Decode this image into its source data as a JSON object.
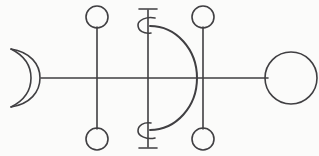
{
  "figure": {
    "title": "Alchemical line symbol diagram",
    "background_color": "#fbfbfa",
    "stroke_color": "#403f42",
    "width": 319,
    "height": 156,
    "baseline_y": 78,
    "elements": {
      "crescent": {
        "label": "crescent-moon",
        "cx": 24,
        "cy": 78,
        "outer_radius": 30,
        "opening": "left"
      },
      "baseline": {
        "label": "horizontal-axis-line",
        "x1": 41,
        "x2": 268,
        "y": 78
      },
      "left_vertical": {
        "label": "left-vertical-stem",
        "x": 97,
        "y1": 25,
        "y2": 131
      },
      "right_vertical": {
        "label": "right-vertical-stem",
        "x": 203,
        "y1": 25,
        "y2": 131
      },
      "center_vertical": {
        "label": "center-vertical-stem",
        "x": 148,
        "y1": 9,
        "y2": 148
      },
      "center_cap_top": {
        "label": "center-top-serif-cap",
        "x1": 139,
        "x2": 157,
        "y": 9
      },
      "center_cap_bottom": {
        "label": "center-bottom-serif-cap",
        "x1": 139,
        "x2": 157,
        "y": 148
      },
      "curl_top": {
        "label": "center-top-curl",
        "cx": 147,
        "cy": 25,
        "radius": 9
      },
      "curl_bottom": {
        "label": "center-bottom-curl",
        "cx": 147,
        "cy": 131,
        "radius": 9
      },
      "d_arc": {
        "label": "d-shaped-arc",
        "start_x": 150,
        "start_y": 26,
        "end_x": 150,
        "end_y": 130,
        "apex_x": 197,
        "apex_y": 78
      },
      "circles": [
        {
          "label": "small-circle-top-left",
          "cx": 97,
          "cy": 17,
          "r": 11
        },
        {
          "label": "small-circle-bottom-left",
          "cx": 97,
          "cy": 139,
          "r": 11
        },
        {
          "label": "small-circle-top-right",
          "cx": 203,
          "cy": 17,
          "r": 11
        },
        {
          "label": "small-circle-bottom-right",
          "cx": 203,
          "cy": 139,
          "r": 11
        },
        {
          "label": "large-circle-right",
          "cx": 291,
          "cy": 78,
          "r": 26
        }
      ]
    }
  }
}
